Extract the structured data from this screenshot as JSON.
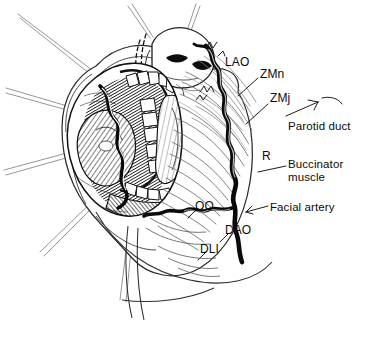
{
  "figure": {
    "style": "black-and-white pen-and-ink medical illustration",
    "background_color": "#ffffff",
    "ink_color": "#111111"
  },
  "labels": [
    {
      "id": "lao",
      "text": "LAO",
      "x": 225,
      "y": 56,
      "kind": "abbreviation",
      "meaning": "levator anguli oris"
    },
    {
      "id": "zmn",
      "text": "ZMn",
      "x": 260,
      "y": 68,
      "kind": "abbreviation",
      "meaning": "zygomaticus minor"
    },
    {
      "id": "zmj",
      "text": "ZMj",
      "x": 270,
      "y": 92,
      "kind": "abbreviation",
      "meaning": "zygomaticus major"
    },
    {
      "id": "parotid-duct",
      "text": "Parotid duct",
      "x": 288,
      "y": 120,
      "kind": "structure"
    },
    {
      "id": "r",
      "text": "R",
      "x": 262,
      "y": 150,
      "kind": "abbreviation",
      "meaning": "risorius"
    },
    {
      "id": "buccinator",
      "text": "Buccinator\nmuscle",
      "x": 288,
      "y": 158,
      "kind": "structure"
    },
    {
      "id": "facial-artery",
      "text": "Facial artery",
      "x": 270,
      "y": 201,
      "kind": "structure"
    },
    {
      "id": "oo",
      "text": "OO",
      "x": 195,
      "y": 200,
      "kind": "abbreviation",
      "meaning": "orbicularis oris"
    },
    {
      "id": "dao",
      "text": "DAO",
      "x": 225,
      "y": 224,
      "kind": "abbreviation",
      "meaning": "depressor anguli oris"
    },
    {
      "id": "dli",
      "text": "DLI",
      "x": 200,
      "y": 243,
      "kind": "abbreviation",
      "meaning": "depressor labii inferioris"
    }
  ]
}
